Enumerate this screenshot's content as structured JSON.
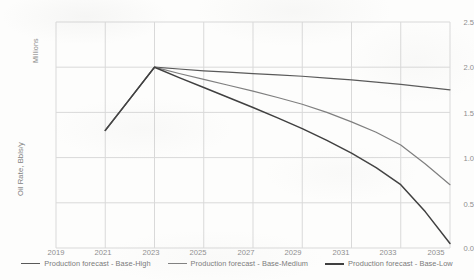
{
  "chart_data": {
    "type": "line",
    "title": "",
    "xlabel": "",
    "ylabel": "Oil Rate, Bbls/y",
    "y_units_note": "Millions",
    "xlim": [
      2019,
      2035
    ],
    "ylim": [
      0.0,
      2.5
    ],
    "grid": true,
    "legend_position": "bottom",
    "x_tick_labels": [
      "2019",
      "2021",
      "2023",
      "2025",
      "2027",
      "2029",
      "2031",
      "2033",
      "2035"
    ],
    "y_tick_labels": [
      "0.0",
      "0.5",
      "1.0",
      "1.5",
      "2.0",
      "2.5"
    ],
    "x": [
      2021,
      2022,
      2023,
      2024,
      2025,
      2026,
      2027,
      2028,
      2029,
      2030,
      2031,
      2032,
      2033,
      2034,
      2035
    ],
    "series": [
      {
        "name": "Production forecast - Base-High",
        "color": "#595959",
        "width": 1.2,
        "values": [
          1.3,
          1.65,
          2.0,
          1.98,
          1.96,
          1.945,
          1.93,
          1.915,
          1.9,
          1.88,
          1.86,
          1.835,
          1.81,
          1.78,
          1.75
        ]
      },
      {
        "name": "Production forecast - Base-Medium",
        "color": "#7f7f7f",
        "width": 1.2,
        "values": [
          1.3,
          1.65,
          2.0,
          1.93,
          1.865,
          1.8,
          1.735,
          1.665,
          1.59,
          1.5,
          1.395,
          1.28,
          1.14,
          0.93,
          0.7
        ]
      },
      {
        "name": "Production forecast - Base-Low",
        "color": "#404040",
        "width": 1.5,
        "values": [
          1.3,
          1.65,
          2.0,
          1.885,
          1.775,
          1.665,
          1.555,
          1.44,
          1.32,
          1.19,
          1.05,
          0.89,
          0.7,
          0.4,
          0.05
        ]
      }
    ]
  },
  "legend": {
    "entries": [
      {
        "label": "Production forecast - Base-High"
      },
      {
        "label": "Production forecast - Base-Medium"
      },
      {
        "label": "Production forecast - Base-Low"
      }
    ]
  },
  "axes": {
    "y_title": "Oil Rate, Bbls/y",
    "y_units": "Millions",
    "y_ticks": [
      "2.5",
      "2.0",
      "1.5",
      "1.0",
      "0.5",
      "0.0"
    ],
    "x_ticks": [
      "2019",
      "2021",
      "2023",
      "2025",
      "2027",
      "2029",
      "2031",
      "2033",
      "2035"
    ]
  }
}
